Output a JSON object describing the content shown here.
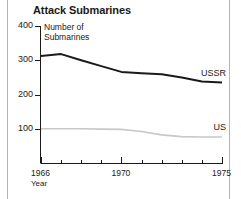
{
  "chart_data": {
    "type": "line",
    "title": "Attack Submarines",
    "ylabel": "Number of\nSubmarines",
    "xlabel": "Year",
    "xlim": [
      1966,
      1975
    ],
    "ylim": [
      0,
      400
    ],
    "grid": false,
    "legend_position": "inline-right",
    "ytick_labels": [
      "400",
      "300",
      "200",
      "100"
    ],
    "ytick_values": [
      400,
      300,
      200,
      100
    ],
    "xtick_values": [
      1966,
      1967,
      1968,
      1969,
      1970,
      1971,
      1972,
      1973,
      1974,
      1975
    ],
    "xtick_labels": [
      "1966",
      "",
      "",
      "",
      "1970",
      "",
      "",
      "",
      "",
      "1975"
    ],
    "x": [
      1966,
      1967,
      1968,
      1969,
      1970,
      1971,
      1972,
      1973,
      1974,
      1975
    ],
    "series": [
      {
        "name": "USSR",
        "color": "#1a1a1a",
        "values": [
          312,
          318,
          300,
          283,
          266,
          262,
          259,
          250,
          238,
          235
        ]
      },
      {
        "name": "US",
        "color": "#c8c8c8",
        "values": [
          100,
          100,
          100,
          99,
          98,
          92,
          82,
          77,
          76,
          76
        ]
      }
    ]
  },
  "axis_frame": {
    "left_rule": "vertical-divider",
    "right_rule": "vertical-divider"
  }
}
